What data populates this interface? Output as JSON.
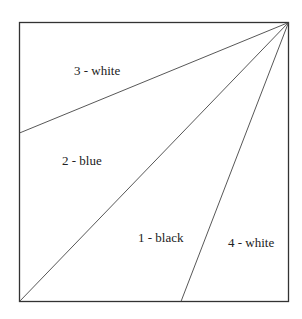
{
  "diagram": {
    "frame": {
      "x1": 19.5,
      "y1": 22.5,
      "x2": 288.5,
      "y2": 301.5,
      "stroke": "#333333"
    },
    "apex": {
      "x": 288.5,
      "y": 22.5
    },
    "lines": [
      {
        "name": "line-to-left-edge",
        "x": 19.5,
        "y": 133
      },
      {
        "name": "line-to-bottom-left-corner",
        "x": 19.5,
        "y": 301.5
      },
      {
        "name": "line-to-bottom-edge",
        "x": 181,
        "y": 301.5
      }
    ],
    "regions": [
      {
        "id": "region-3",
        "label": "3 - white",
        "x": 74,
        "y": 75
      },
      {
        "id": "region-2",
        "label": "2 - blue",
        "x": 62,
        "y": 165
      },
      {
        "id": "region-1",
        "label": "1 - black",
        "x": 138,
        "y": 242
      },
      {
        "id": "region-4",
        "label": "4 - white",
        "x": 228,
        "y": 247
      }
    ]
  }
}
